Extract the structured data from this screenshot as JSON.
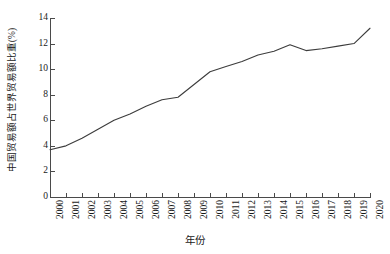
{
  "chart_data": {
    "type": "line",
    "title": "",
    "xlabel": "年份",
    "ylabel": "中国贸易额占世界贸易额比重(%)",
    "categories": [
      "2000",
      "2001",
      "2002",
      "2003",
      "2004",
      "2005",
      "2006",
      "2007",
      "2008",
      "2009",
      "2010",
      "2011",
      "2012",
      "2013",
      "2014",
      "2015",
      "2016",
      "2017",
      "2018",
      "2019",
      "2020"
    ],
    "x": [
      2000,
      2001,
      2002,
      2003,
      2004,
      2005,
      2006,
      2007,
      2008,
      2009,
      2010,
      2011,
      2012,
      2013,
      2014,
      2015,
      2016,
      2017,
      2018,
      2019,
      2020
    ],
    "values": [
      3.7,
      4.0,
      4.6,
      5.3,
      6.0,
      6.5,
      7.1,
      7.6,
      7.8,
      8.8,
      9.8,
      10.2,
      10.6,
      11.1,
      11.4,
      11.9,
      11.45,
      11.6,
      11.8,
      12.0,
      13.2
    ],
    "series": [
      {
        "name": "中国贸易额占世界贸易额比重(%)",
        "values": [
          3.7,
          4.0,
          4.6,
          5.3,
          6.0,
          6.5,
          7.1,
          7.6,
          7.8,
          8.8,
          9.8,
          10.2,
          10.6,
          11.1,
          11.4,
          11.9,
          11.45,
          11.6,
          11.8,
          12.0,
          13.2
        ]
      }
    ],
    "ylim": [
      0,
      14
    ],
    "xlim": [
      2000,
      2020
    ],
    "ytick_labels": [
      "0",
      "2",
      "4",
      "6",
      "8",
      "10",
      "12",
      "14"
    ],
    "ytick_values": [
      0,
      2,
      4,
      6,
      8,
      10,
      12,
      14
    ],
    "xtick_labels": [
      "2000",
      "2001",
      "2002",
      "2003",
      "2004",
      "2005",
      "2006",
      "2007",
      "2008",
      "2009",
      "2010",
      "2011",
      "2012",
      "2013",
      "2014",
      "2015",
      "2016",
      "2017",
      "2018",
      "2019",
      "2020"
    ],
    "grid": false,
    "legend": false,
    "legend_position": "none",
    "line_color": "#3c3c3c",
    "axis_color": "#4a4a4a",
    "background_color": "#ffffff"
  }
}
